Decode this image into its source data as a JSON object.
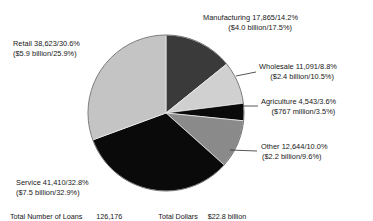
{
  "chart_data": {
    "type": "pie",
    "title": "",
    "subtitle": "",
    "xlabel": "",
    "ylabel": "",
    "legend_position": "callout-labels",
    "grid": false,
    "categories": [
      "Manufacturing",
      "Wholesale",
      "Agriculture",
      "Other",
      "Service",
      "Retail"
    ],
    "values": [
      14.2,
      8.8,
      3.6,
      10.0,
      32.8,
      30.6
    ],
    "counts": [
      17865,
      11091,
      4543,
      12644,
      41410,
      38623
    ],
    "dollars": [
      "$4.0 billion",
      "$2.4 billion",
      "$767 million",
      "$2.2 billion",
      "$7.5 billion",
      "$5.9 billion"
    ],
    "dollar_percents": [
      17.5,
      10.5,
      3.5,
      9.6,
      32.9,
      25.9
    ],
    "colors": [
      "#3a3a3a",
      "#d0d0d0",
      "#0a0a0a",
      "#8a8a8a",
      "#0a0a0a",
      "#c4c4c4"
    ],
    "start_angle_deg": 0,
    "direction": "clockwise",
    "totals": {
      "loans_label": "Total Number of Loans",
      "loans_value": "126,176",
      "dollars_label": "Total Dollars",
      "dollars_value": "$22.8 billion"
    }
  },
  "labels": {
    "manufacturing": {
      "line1": "Manufacturing 17,865/14.2%",
      "line2": "($4.0 billion/17.5%)"
    },
    "wholesale": {
      "line1": "Wholesale 11,091/8.8%",
      "line2": "($2.4 billion/10.5%)"
    },
    "agriculture": {
      "line1": "Agriculture 4,543/3.6%",
      "line2": "($767 million/3.5%)"
    },
    "other": {
      "line1": "Other 12,644/10.0%",
      "line2": "($2.2 billion/9.6%)"
    },
    "retail": {
      "line1": "Retail 38,623/30.6%",
      "line2": "($5.9 billion/25.9%)"
    },
    "service": {
      "line1": "Service 41,410/32.8%",
      "line2": "($7.5 billion/32.9%)"
    }
  },
  "footer": {
    "loans_label": "Total Number of Loans",
    "loans_value": "126,176",
    "dollars_label": "Total Dollars",
    "dollars_value": "$22.8 billion"
  }
}
